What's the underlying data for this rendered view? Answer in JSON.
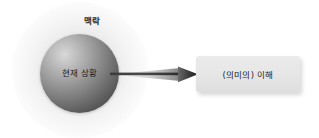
{
  "diagram": {
    "title": "",
    "background_color": "#ffffff",
    "context": {
      "label": "맥락",
      "icon": "halo-glow"
    },
    "sphere": {
      "label": "현재 상황",
      "shape": "sphere",
      "gradient_light": "#d9d9d9",
      "gradient_dark": "#3f3f3f"
    },
    "arrow": {
      "icon": "arrow-right-icon",
      "color": "#2b2b2b",
      "direction": "right"
    },
    "result": {
      "label": "(의미의) 이해",
      "box_color": "#e6e6e6",
      "text_color": "#232323"
    }
  }
}
